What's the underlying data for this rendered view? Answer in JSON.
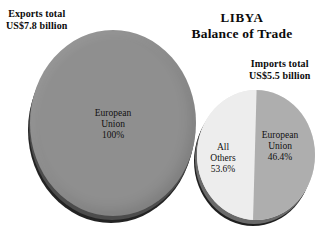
{
  "title": {
    "main": "LIBYA",
    "sub": "Balance of Trade"
  },
  "annotations": {
    "exports_total": "Exports total\nUS$7.8 billion",
    "exports_total_line1": "Exports total",
    "exports_total_line2": "US$7.8 billion",
    "imports_total_line1": "Imports total",
    "imports_total_line2": "US$5.5 billion"
  },
  "colors": {
    "exports_slice": "#8f8f8f",
    "imports_eu_slice": "#aeaeae",
    "imports_others_slice": "#ededed",
    "pie_depth": "#232323",
    "background": "#ffffff",
    "text": "#0b0b0b"
  },
  "chart_data": [
    {
      "type": "pie",
      "title": "Exports total US$7.8 billion",
      "total_label": "US$7.8 billion",
      "total_value": 7.8,
      "total_units": "US$ billion",
      "categories": [
        "European Union"
      ],
      "values": [
        100
      ],
      "value_suffix": "%",
      "labels": [
        "European Union\n100%"
      ],
      "slice_label_lines": [
        [
          "European Union",
          "Union",
          "100%"
        ]
      ],
      "legend": "none",
      "three_d": true
    },
    {
      "type": "pie",
      "title": "Imports total US$5.5 billion",
      "total_label": "US$5.5 billion",
      "total_value": 5.5,
      "total_units": "US$ billion",
      "categories": [
        "All Others",
        "European Union"
      ],
      "values": [
        53.6,
        46.4
      ],
      "value_suffix": "%",
      "legend": "none",
      "three_d": true
    }
  ],
  "pies": {
    "exports": {
      "slice_label_name_1": "European",
      "slice_label_name_2": "Union",
      "slice_label_value": "100%"
    },
    "imports": {
      "others_line1": "All",
      "others_line2": "Others",
      "others_value": "53.6%",
      "eu_line1": "European",
      "eu_line2": "Union",
      "eu_value": "46.4%"
    }
  }
}
